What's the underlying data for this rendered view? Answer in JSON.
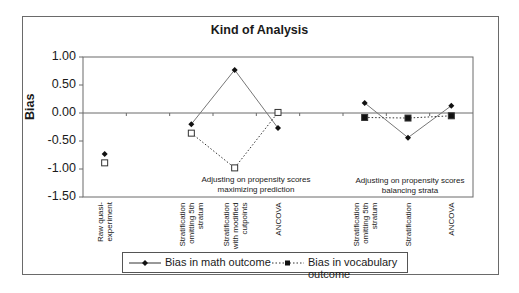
{
  "chart_data": {
    "type": "line",
    "title": "Kind of Analysis",
    "xlabel": "",
    "ylabel": "Bias",
    "ylim": [
      -1.5,
      1.0
    ],
    "yticks": [
      "1.00",
      "0.50",
      "0.00",
      "-0.50",
      "-1.00",
      "-1.50"
    ],
    "grid": false,
    "legend_position": "bottom",
    "categories": [
      "Raw quasi-experiment",
      "",
      "Stratification omitting 5th stratum",
      "Stratification with modified cutpoints",
      "ANCOVA",
      "",
      "Stratification omitting 5th stratum",
      "Stratification",
      "ANCOVA"
    ],
    "series": [
      {
        "name": "Bias in math outcome",
        "marker": "diamond",
        "line": "solid",
        "values": [
          -0.73,
          null,
          -0.2,
          0.77,
          -0.27,
          null,
          0.18,
          -0.44,
          0.13
        ],
        "segments": [
          [
            2,
            4
          ],
          [
            6,
            8
          ]
        ]
      },
      {
        "name": "Bias in vocabulary outcome",
        "marker": "square",
        "line": "dotted",
        "values": [
          -0.89,
          null,
          -0.36,
          -0.98,
          0.01,
          null,
          -0.08,
          -0.09,
          -0.05
        ],
        "segments": [
          [
            2,
            4
          ],
          [
            6,
            8
          ]
        ]
      }
    ],
    "annotations": [
      {
        "text": "Adjusting on propensity scores\nmaximizing prediction",
        "group": [
          2,
          4
        ]
      },
      {
        "text": "Adjusting on propensity scores\nbalancing strata",
        "group": [
          6,
          8
        ]
      }
    ]
  },
  "labels": {
    "title": "Kind of Analysis",
    "ylabel": "Bias",
    "yticks": [
      "1.00",
      "0.50",
      "0.00",
      "-0.50",
      "-1.00",
      "-1.50"
    ],
    "xcats": [
      "Raw quasi-\nexperiment",
      "",
      "Stratification\nomitting 5th\nstratum",
      "Stratification\nwith modified\ncutpoints",
      "ANCOVA",
      "",
      "Stratification\nomitting 5th\nstratum",
      "Stratification",
      "ANCOVA"
    ],
    "annot1_line1": "Adjusting on propensity scores",
    "annot1_line2": "maximizing prediction",
    "annot2_line1": "Adjusting on propensity scores",
    "annot2_line2": "balancing strata",
    "legend_math": "Bias in math outcome",
    "legend_vocab": "Bias in vocabulary outcome"
  }
}
